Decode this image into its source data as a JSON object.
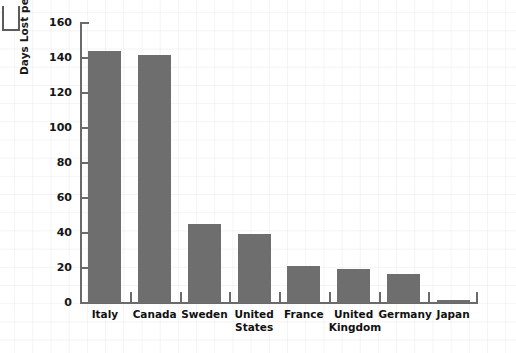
{
  "chart_data": {
    "type": "bar",
    "title": "",
    "xlabel": "",
    "ylabel": "Days Lost per Thousand Workers per Year",
    "categories": [
      "Italy",
      "Canada",
      "Sweden",
      "United States",
      "France",
      "United Kingdom",
      "Germany",
      "Japan"
    ],
    "values": [
      144,
      142,
      45,
      39.5,
      21,
      19.5,
      16.5,
      2
    ],
    "ylim": [
      0,
      160
    ],
    "ytick_labels": [
      "160",
      "140",
      "120",
      "100",
      "80",
      "60",
      "40",
      "20",
      "0"
    ],
    "ytick_values": [
      160,
      140,
      120,
      100,
      80,
      60,
      40,
      20,
      0
    ],
    "grid": true,
    "legend": null,
    "bar_color": "#6e6e6e",
    "axis_color": "#6a6a6a",
    "text_color": "#111111",
    "background_color": "#ffffff"
  },
  "axis": {
    "y_title": "Days Lost per Thousand Workers per Year"
  }
}
